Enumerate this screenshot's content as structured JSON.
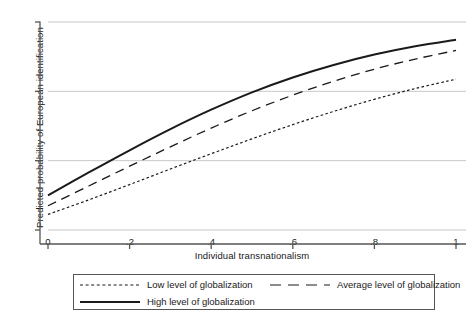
{
  "chart_data": {
    "type": "line",
    "title": "",
    "subtitle": "",
    "xlabel": "Individual transnationalism",
    "ylabel": "Predicted probability of European identification",
    "xlim": [
      0,
      1
    ],
    "ylim": [
      0.4,
      1
    ],
    "xticks": [
      "0",
      ".2",
      ".4",
      ".6",
      ".8",
      "1"
    ],
    "xtick_values": [
      0,
      0.2,
      0.4,
      0.6,
      0.8,
      1
    ],
    "yticks": [
      ".4",
      ".6",
      ".8",
      "1"
    ],
    "ytick_values": [
      0.4,
      0.6,
      0.8,
      1
    ],
    "grid": "horizontal",
    "legend_position": "bottom",
    "x": [
      0,
      0.1,
      0.2,
      0.3,
      0.4,
      0.5,
      0.6,
      0.7,
      0.8,
      0.9,
      1
    ],
    "series": [
      {
        "name": "Low level of globalization",
        "style": "dotted",
        "color": "#1a1a1a",
        "values": [
          0.445,
          0.487,
          0.531,
          0.576,
          0.62,
          0.663,
          0.704,
          0.742,
          0.777,
          0.808,
          0.835
        ]
      },
      {
        "name": "Average level of globalization",
        "style": "dashed",
        "color": "#1a1a1a",
        "values": [
          0.47,
          0.527,
          0.584,
          0.64,
          0.694,
          0.744,
          0.789,
          0.829,
          0.864,
          0.893,
          0.918
        ]
      },
      {
        "name": "High level of globalization",
        "style": "solid",
        "color": "#1a1a1a",
        "values": [
          0.5,
          0.566,
          0.63,
          0.691,
          0.747,
          0.797,
          0.84,
          0.876,
          0.906,
          0.93,
          0.949
        ]
      }
    ]
  },
  "axes": {
    "y_title": "Predicted probability of European identification",
    "x_title": "Individual transnationalism",
    "y_tick_labels": [
      "1",
      ".8",
      ".6",
      ".4"
    ],
    "x_tick_labels": [
      "0",
      ".2",
      ".4",
      ".6",
      ".8",
      "1"
    ]
  },
  "legend": {
    "low_label": "Low level of globalization",
    "average_label": "Average level of globalization",
    "high_label": "High level of globalization"
  },
  "colors": {
    "line": "#1a1a1a",
    "grid": "#c8c8c8",
    "axis": "#555555",
    "background": "#ffffff"
  }
}
